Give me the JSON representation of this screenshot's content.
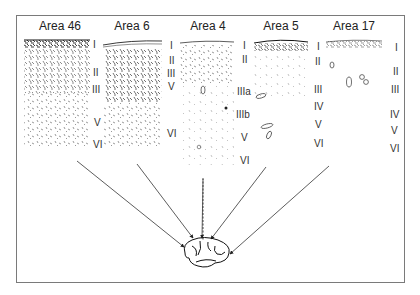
{
  "figure": {
    "areas": [
      {
        "title": "Area 46",
        "x": 60,
        "layers": [
          {
            "label": "I",
            "x": 93,
            "y": 44
          },
          {
            "label": "II",
            "x": 94,
            "y": 70
          },
          {
            "label": "III",
            "x": 93,
            "y": 87
          },
          {
            "label": "V",
            "x": 95,
            "y": 120
          },
          {
            "label": "VI",
            "x": 93,
            "y": 142
          }
        ]
      },
      {
        "title": "Area 6",
        "x": 132,
        "layers": [
          {
            "label": "I",
            "x": 170,
            "y": 44
          },
          {
            "label": "II",
            "x": 170,
            "y": 59
          },
          {
            "label": "III",
            "x": 168,
            "y": 71
          },
          {
            "label": "V",
            "x": 169,
            "y": 83
          },
          {
            "label": "VI",
            "x": 168,
            "y": 130
          }
        ]
      },
      {
        "title": "Area 4",
        "x": 208,
        "layers": [
          {
            "label": "I",
            "x": 242,
            "y": 43
          },
          {
            "label": "II",
            "x": 242,
            "y": 57
          },
          {
            "label": "IIIa",
            "x": 238,
            "y": 89
          },
          {
            "label": "IIIb",
            "x": 237,
            "y": 112
          },
          {
            "label": "V",
            "x": 241,
            "y": 134
          },
          {
            "label": "VI",
            "x": 240,
            "y": 157
          }
        ]
      },
      {
        "title": "Area 5",
        "x": 280,
        "layers": [
          {
            "label": "I",
            "x": 316,
            "y": 43
          },
          {
            "label": "II",
            "x": 315,
            "y": 59
          },
          {
            "label": "III",
            "x": 314,
            "y": 87
          },
          {
            "label": "IV",
            "x": 314,
            "y": 104
          },
          {
            "label": "V",
            "x": 315,
            "y": 121
          },
          {
            "label": "VI",
            "x": 314,
            "y": 140
          }
        ]
      },
      {
        "title": "Area 17",
        "x": 354,
        "layers": [
          {
            "label": "I",
            "x": 394,
            "y": 44
          },
          {
            "label": "II",
            "x": 393,
            "y": 68
          },
          {
            "label": "III",
            "x": 391,
            "y": 87
          },
          {
            "label": "IV",
            "x": 390,
            "y": 111
          },
          {
            "label": "V",
            "x": 391,
            "y": 126
          },
          {
            "label": "VI",
            "x": 390,
            "y": 145
          }
        ]
      }
    ],
    "arrow_target": "brain-illustration"
  }
}
